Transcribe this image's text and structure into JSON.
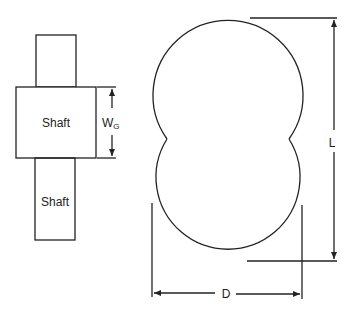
{
  "diagram": {
    "left_figure": {
      "top_shaft_label": "",
      "gear_label": "Shaft",
      "bottom_shaft_label": "Shaft",
      "width_dimension": {
        "symbol": "W",
        "subscript": "G"
      }
    },
    "right_figure": {
      "shape": "double-lobed profile (two overlapping circles)",
      "length_dimension": "L",
      "diameter_dimension": "D"
    },
    "colors": {
      "stroke": "#222222",
      "background": "#ffffff"
    }
  }
}
